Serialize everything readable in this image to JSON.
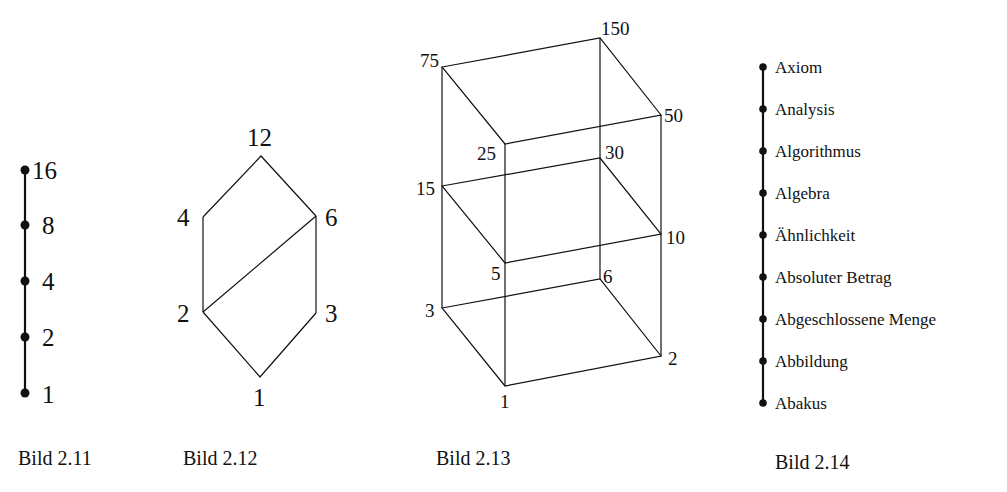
{
  "figures": [
    {
      "caption": "Bild 2.11",
      "type": "chain",
      "nodes": [
        "16",
        "8",
        "4",
        "2",
        "1"
      ]
    },
    {
      "caption": "Bild 2.12",
      "type": "lattice",
      "nodes": {
        "top": "12",
        "upper_left": "4",
        "upper_right": "6",
        "lower_left": "2",
        "lower_right": "3",
        "bottom": "1"
      },
      "edges": [
        [
          "12",
          "4"
        ],
        [
          "12",
          "6"
        ],
        [
          "4",
          "2"
        ],
        [
          "6",
          "2"
        ],
        [
          "6",
          "3"
        ],
        [
          "2",
          "1"
        ],
        [
          "3",
          "1"
        ]
      ]
    },
    {
      "caption": "Bild 2.13",
      "type": "lattice",
      "nodes": {
        "n75": "75",
        "n150": "150",
        "n25": "25",
        "n50": "50",
        "n15": "15",
        "n30": "30",
        "n5": "5",
        "n10": "10",
        "n3": "3",
        "n6": "6",
        "n1": "1",
        "n2": "2"
      },
      "edges": [
        [
          "75",
          "150"
        ],
        [
          "75",
          "25"
        ],
        [
          "150",
          "50"
        ],
        [
          "25",
          "50"
        ],
        [
          "15",
          "30"
        ],
        [
          "15",
          "5"
        ],
        [
          "30",
          "10"
        ],
        [
          "5",
          "10"
        ],
        [
          "3",
          "6"
        ],
        [
          "3",
          "1"
        ],
        [
          "6",
          "2"
        ],
        [
          "1",
          "2"
        ],
        [
          "75",
          "15"
        ],
        [
          "15",
          "3"
        ],
        [
          "150",
          "30"
        ],
        [
          "30",
          "6"
        ],
        [
          "25",
          "5"
        ],
        [
          "5",
          "1"
        ],
        [
          "50",
          "10"
        ],
        [
          "10",
          "2"
        ]
      ]
    },
    {
      "caption": "Bild 2.14",
      "type": "chain",
      "nodes": [
        "Axiom",
        "Analysis",
        "Algorithmus",
        "Algebra",
        "Ähnlichkeit",
        "Absoluter Betrag",
        "Abgeschlossene Menge",
        "Abbildung",
        "Abakus"
      ]
    }
  ]
}
